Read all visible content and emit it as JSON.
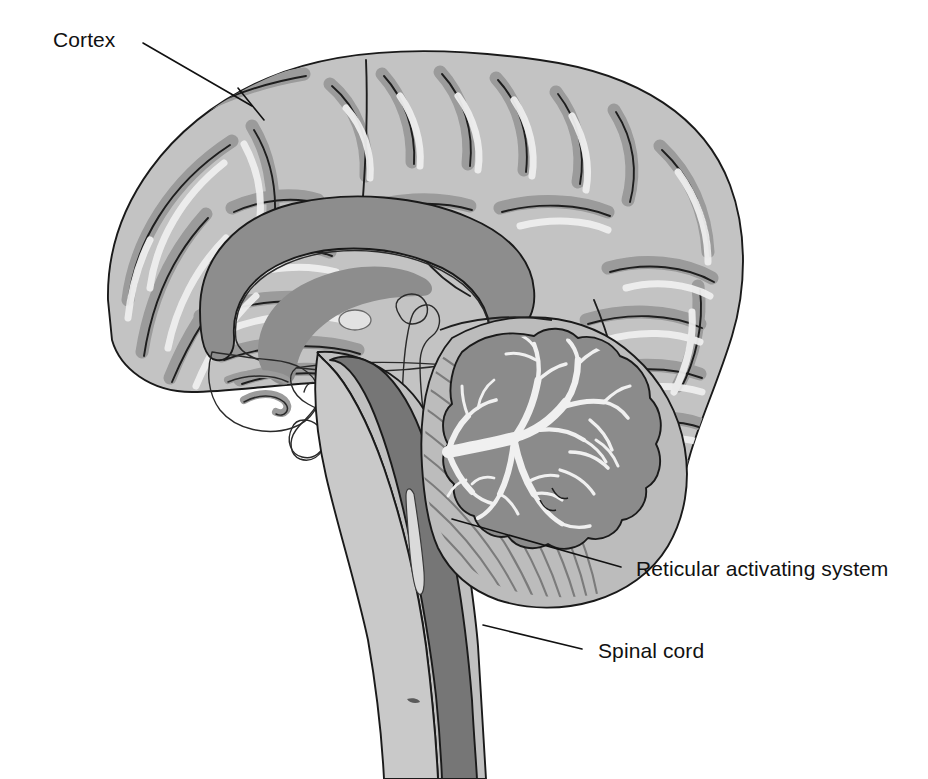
{
  "figure": {
    "background_color": "#ffffff",
    "width": 928,
    "height": 779
  },
  "palette": {
    "outline": "#1a1a1a",
    "cortex_light_gray": "#c2c2c2",
    "gray_matter_band": "#9c9c9c",
    "white_matter": "#b8b8b8",
    "deep_gray": "#8d8d8d",
    "dark_gray_tract": "#767676",
    "cerebellum_cortex": "#8a8a8a",
    "arbor_vitae_white": "#eeeeee",
    "ventricle_pale": "#dcdcdc",
    "highlight": "#efefef",
    "label_text": "#111111"
  },
  "labels": [
    {
      "id": "cortex",
      "text": "Cortex",
      "text_x": 53,
      "text_y": 47,
      "anchor": "start",
      "leader_from_x": 143,
      "leader_from_y": 43,
      "leader_to_x": 252,
      "leader_to_y": 106,
      "tick_x": 240,
      "tick_y": 90,
      "tick_x2": 262,
      "tick_y2": 118
    },
    {
      "id": "reticular-activating-system",
      "text": "Reticular activating system",
      "text_x": 636,
      "text_y": 576,
      "anchor": "start",
      "leader_from_x": 621,
      "leader_from_y": 567,
      "leader_to_x": 452,
      "leader_to_y": 519
    },
    {
      "id": "spinal-cord",
      "text": "Spinal cord",
      "text_x": 598,
      "text_y": 658,
      "anchor": "start",
      "leader_from_x": 582,
      "leader_from_y": 649,
      "leader_to_x": 483,
      "leader_to_y": 625
    }
  ],
  "structures": [
    {
      "id": "cerebral-cortex",
      "name": "Cerebral cortex"
    },
    {
      "id": "corpus-callosum",
      "name": "Corpus callosum"
    },
    {
      "id": "thalamus",
      "name": "Thalamus"
    },
    {
      "id": "ventricle",
      "name": "Ventricle"
    },
    {
      "id": "pituitary-gland",
      "name": "Pituitary gland"
    },
    {
      "id": "cerebellum",
      "name": "Cerebellum"
    },
    {
      "id": "arbor-vitae",
      "name": "Arbor vitae"
    },
    {
      "id": "brainstem",
      "name": "Brainstem"
    },
    {
      "id": "spinal-cord-structure",
      "name": "Spinal cord"
    },
    {
      "id": "reticular-formation",
      "name": "Reticular formation"
    }
  ]
}
